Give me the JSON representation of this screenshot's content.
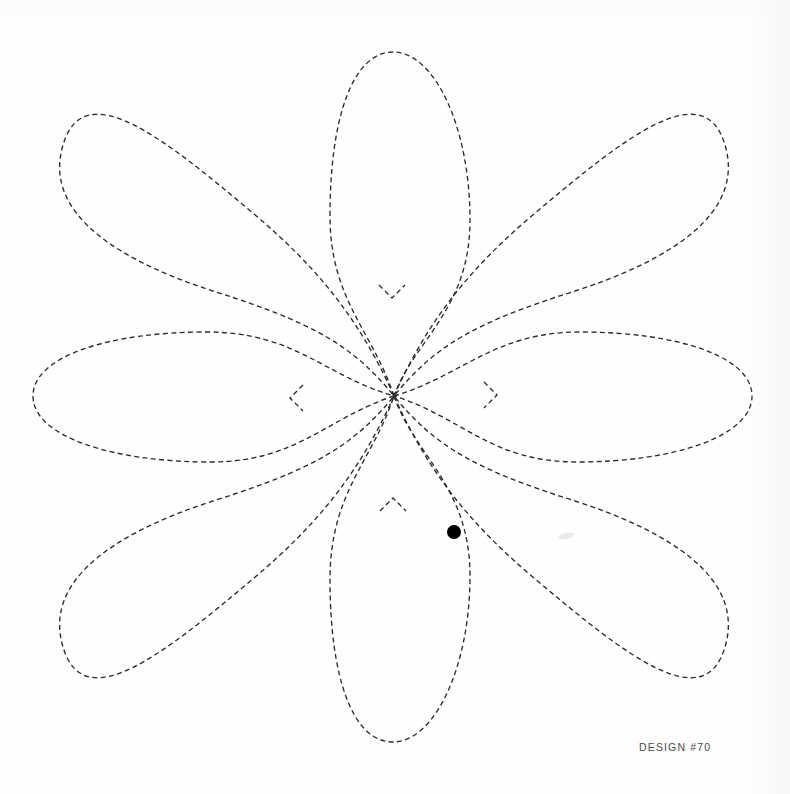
{
  "sheet": {
    "width": 790,
    "height": 794,
    "background_color": "#fefefe",
    "caption": "DESIGN #70",
    "caption_color": "#4a4a4a",
    "stroke_color": "#2b2b2b",
    "stroke_width": 1.35,
    "dash_pattern": "5 3.4",
    "marker_color": "#000000"
  },
  "chart_data": {
    "type": "line",
    "title": "DESIGN #70",
    "xlabel": "",
    "ylabel": "",
    "grid": false,
    "legend": "none",
    "xlim": [
      0,
      790
    ],
    "ylim": [
      0,
      794
    ],
    "center": {
      "x": 394,
      "y": 396
    },
    "petal_count": 8,
    "series": [
      {
        "name": "petal-top",
        "kind": "axis-loop",
        "tip": {
          "x": 392,
          "y": 52
        },
        "path": "M 394 396 C 372 330 330 300 330 215 C 330 120 352 52 393 52 C 434 52 470 126 470 220 C 470 310 414 340 394 396 Z"
      },
      {
        "name": "petal-right",
        "kind": "axis-loop",
        "tip": {
          "x": 752,
          "y": 396
        },
        "path": "M 394 396 C 462 376 494 332 580 332 C 676 332 752 356 752 396 C 752 437 672 462 578 462 C 490 462 464 418 394 396 Z"
      },
      {
        "name": "petal-bottom",
        "kind": "axis-loop",
        "tip": {
          "x": 393,
          "y": 742
        },
        "path": "M 394 396 C 414 455 470 486 470 576 C 470 668 434 742 393 742 C 352 742 330 676 330 580 C 330 492 372 462 394 396 Z"
      },
      {
        "name": "petal-left",
        "kind": "axis-loop",
        "tip": {
          "x": 33,
          "y": 396
        },
        "path": "M 394 396 C 326 418 298 462 210 462 C 114 462 33 437 33 396 C 33 356 110 332 206 332 C 296 332 324 376 394 396 Z"
      },
      {
        "name": "petal-top-left",
        "kind": "diagonal-teardrop",
        "tip": {
          "x": 108,
          "y": 133
        },
        "path": "M 394 396 C 360 320 318 268 254 214 C 164 138 84 74 63 145 C 42 215 122 262 216 292 C 310 322 352 344 394 396 Z"
      },
      {
        "name": "petal-top-right",
        "kind": "diagonal-teardrop",
        "tip": {
          "x": 680,
          "y": 133
        },
        "path": "M 394 396 C 428 320 470 268 534 214 C 624 138 704 74 725 145 C 746 215 666 262 572 292 C 478 322 436 344 394 396 Z"
      },
      {
        "name": "petal-bottom-right",
        "kind": "diagonal-teardrop",
        "tip": {
          "x": 680,
          "y": 661
        },
        "path": "M 394 396 C 428 472 470 524 534 578 C 624 654 704 718 725 647 C 746 577 666 530 572 500 C 478 470 436 448 394 396 Z"
      },
      {
        "name": "petal-bottom-left",
        "kind": "diagonal-teardrop",
        "tip": {
          "x": 108,
          "y": 661
        },
        "path": "M 394 396 C 360 472 318 524 254 578 C 164 654 84 718 63 647 C 42 577 122 530 216 500 C 310 470 352 448 394 396 Z"
      }
    ],
    "cusps": [
      {
        "name": "cusp-top",
        "x": 392,
        "y": 298,
        "orientation": "down"
      },
      {
        "name": "cusp-bottom",
        "x": 393,
        "y": 498,
        "orientation": "up"
      },
      {
        "name": "cusp-left",
        "x": 290,
        "y": 398,
        "orientation": "right"
      },
      {
        "name": "cusp-right",
        "x": 497,
        "y": 395,
        "orientation": "left"
      }
    ],
    "annotations": [
      {
        "name": "start-point-marker",
        "x": 454,
        "y": 532,
        "radius": 7,
        "color": "#000000",
        "label": ""
      }
    ]
  }
}
